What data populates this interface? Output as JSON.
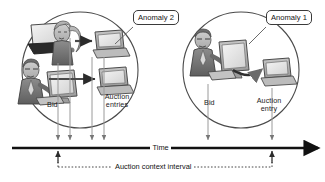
{
  "figure": {
    "background": "#ffffff",
    "ink": "#2b2b2b"
  },
  "callouts": [
    {
      "id": "anomaly-2",
      "label": "Anomaly 2",
      "x": 133,
      "y": 10
    },
    {
      "id": "anomaly-1",
      "label": "Anomaly 1",
      "x": 266,
      "y": 10
    }
  ],
  "groups": [
    {
      "id": "left-group",
      "circle": {
        "cx": 80,
        "cy": 70,
        "r": 58
      },
      "actors": [
        {
          "id": "woman-with-laptop",
          "kind": "person",
          "desc": "woman holding laptop"
        },
        {
          "id": "man-at-desktop",
          "kind": "person",
          "desc": "man in suit at desktop computer"
        }
      ],
      "devices": [
        {
          "id": "auction-server-top",
          "kind": "laptop"
        },
        {
          "id": "auction-server-bottom",
          "kind": "laptop"
        }
      ],
      "labels": [
        {
          "id": "left-bid-label",
          "text": "Bid",
          "x": 47,
          "y": 101
        },
        {
          "id": "left-auction-entries-label",
          "text": "Auction entries",
          "x": 101,
          "y": 93
        }
      ]
    },
    {
      "id": "right-group",
      "circle": {
        "cx": 241,
        "cy": 70,
        "r": 58
      },
      "actors": [
        {
          "id": "man-at-desktop-right",
          "kind": "person",
          "desc": "man in suit at desktop computer"
        }
      ],
      "devices": [
        {
          "id": "auction-server-right",
          "kind": "laptop"
        }
      ],
      "labels": [
        {
          "id": "right-bid-label",
          "text": "Bid",
          "x": 204,
          "y": 99
        },
        {
          "id": "right-auction-entry-label",
          "text": "Auction entry",
          "x": 253,
          "y": 97
        }
      ]
    }
  ],
  "axis": {
    "label": "Time",
    "label_x": 162,
    "y": 148,
    "x_start": 12,
    "x_end": 318,
    "event_ticks": [
      58,
      70,
      92,
      104,
      208,
      272
    ]
  },
  "interval": {
    "label": "Auction context interval",
    "y": 167,
    "x_start": 58,
    "x_end": 272
  }
}
